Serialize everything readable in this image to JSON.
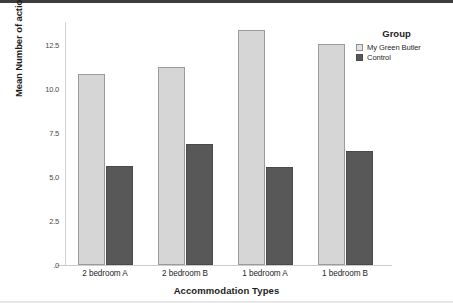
{
  "chart_data": {
    "type": "bar",
    "title": "",
    "xlabel": "Accommodation Types",
    "ylabel": "Mean Number of actions",
    "categories": [
      "2 bedroom A",
      "2 bedroom B",
      "1 bedroom A",
      "1 bedroom B"
    ],
    "series": [
      {
        "name": "My Green Butler",
        "color": "#d6d6d6",
        "values": [
          10.85,
          11.25,
          13.35,
          12.55
        ]
      },
      {
        "name": "Control",
        "color": "#585858",
        "values": [
          5.6,
          6.9,
          5.55,
          6.45
        ]
      }
    ],
    "ylim": [
      0,
      13.8
    ],
    "ytick_values": [
      12.5,
      10.0,
      7.5,
      5.0,
      2.5,
      0
    ],
    "ytick_labels": [
      "12.5",
      "10.0",
      "7.5",
      "5.0",
      "2.5",
      ".0"
    ],
    "grid": false,
    "legend_position": "right-top"
  },
  "legend": {
    "title": "Group",
    "entries": [
      {
        "label": "My Green Butler",
        "swatch": "light"
      },
      {
        "label": "Control",
        "swatch": "dark"
      }
    ]
  },
  "colors": {
    "series_light": "#d6d6d6",
    "series_dark": "#585858",
    "axis": "#cccccc",
    "text": "#1c1c1c",
    "background": "#ffffff"
  }
}
